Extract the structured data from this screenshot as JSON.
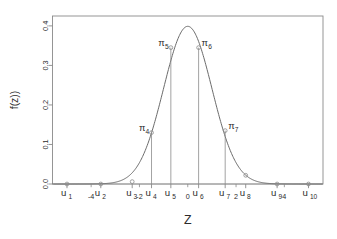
{
  "chart_data": {
    "type": "line",
    "title": "",
    "subtitle": "",
    "xlabel": "Z",
    "ylabel": "f(z))",
    "grid": false,
    "legend": "none",
    "xlim": [
      -5.6,
      5.6
    ],
    "ylim": [
      0.0,
      0.425
    ],
    "curve_name": "standard normal density",
    "curve_formula": "f(z) = (1/sqrt(2*pi)) * exp(-z^2/2)",
    "peak": {
      "x": 0.0,
      "y": 0.4
    },
    "y_ticks": [
      "0.0",
      "0.1",
      "0.2",
      "0.3",
      "0.4"
    ],
    "y_tick_values": [
      0.0,
      0.1,
      0.2,
      0.3,
      0.4
    ],
    "x_tick_numeric_labels": [
      "-4",
      "-2",
      "0",
      "2",
      "4"
    ],
    "x_tick_numeric_values": [
      -4,
      -2,
      0,
      2,
      4
    ],
    "u_points": [
      {
        "label": "u",
        "index": "1",
        "x": -5.0,
        "y": 0.0
      },
      {
        "label": "u",
        "index": "2",
        "x": -3.6,
        "y": 0.0
      },
      {
        "label": "u",
        "index": "3",
        "x": -2.3,
        "y": 0.006
      },
      {
        "label": "u",
        "index": "4",
        "x": -1.5,
        "y": 0.13
      },
      {
        "label": "u",
        "index": "5",
        "x": -0.7,
        "y": 0.345
      },
      {
        "label": "u",
        "index": "6",
        "x": 0.45,
        "y": 0.345
      },
      {
        "label": "u",
        "index": "7",
        "x": 1.55,
        "y": 0.135
      },
      {
        "label": "u",
        "index": "8",
        "x": 2.4,
        "y": 0.022
      },
      {
        "label": "u",
        "index": "9",
        "x": 3.7,
        "y": 0.0
      },
      {
        "label": "u",
        "index": "10",
        "x": 5.0,
        "y": 0.0
      }
    ],
    "pi_segments": [
      {
        "label": "π",
        "index": "4",
        "x": -1.5,
        "top": 0.13,
        "bottom": 0.0
      },
      {
        "label": "π",
        "index": "5",
        "x": -0.7,
        "top": 0.345,
        "bottom": 0.0
      },
      {
        "label": "π",
        "index": "6",
        "x": 0.45,
        "top": 0.345,
        "bottom": 0.0
      },
      {
        "label": "π",
        "index": "7",
        "x": 1.55,
        "top": 0.135,
        "bottom": 0.0
      }
    ],
    "colors": {
      "background": "#ffffff",
      "frame": "#8a8a8a",
      "curve": "#6b6b6b",
      "dropline": "#8a8a8a",
      "text": "#2b2b2b"
    }
  }
}
